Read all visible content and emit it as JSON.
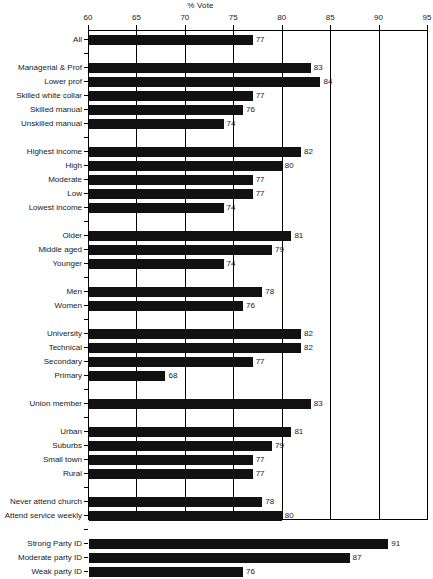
{
  "chart_data": {
    "type": "bar",
    "orientation": "horizontal",
    "title": "% Vote",
    "xlabel": "",
    "ylabel": "",
    "xlim": [
      60,
      95
    ],
    "xticks": [
      60,
      65,
      70,
      75,
      80,
      85,
      90,
      95
    ],
    "grid": true,
    "legend": null,
    "bar_color": "#111111",
    "categories": [
      "All",
      "Managerial & Prof",
      "Lower prof",
      "Skilled white collar",
      "Skilled manual",
      "Unskilled manual",
      "Highest income",
      "High",
      "Moderate",
      "Low",
      "Lowest income",
      "Older",
      "Middle aged",
      "Younger",
      "Men",
      "Women",
      "University",
      "Technical",
      "Secondary",
      "Primary",
      "Union member",
      "Urban",
      "Suburbs",
      "Small town",
      "Rural",
      "Never attend church",
      "Attend service weekly",
      "Strong Party ID",
      "Moderate party ID",
      "Weak party ID"
    ],
    "values": [
      77,
      83,
      84,
      77,
      76,
      74,
      82,
      80,
      77,
      77,
      74,
      81,
      79,
      74,
      78,
      76,
      82,
      82,
      77,
      68,
      83,
      81,
      79,
      77,
      77,
      78,
      80,
      91,
      87,
      76
    ],
    "groups": [
      {
        "name": "overall",
        "categories": [
          "All"
        ]
      },
      {
        "name": "occupation",
        "categories": [
          "Managerial & Prof",
          "Lower prof",
          "Skilled white collar",
          "Skilled manual",
          "Unskilled manual"
        ]
      },
      {
        "name": "income",
        "categories": [
          "Highest income",
          "High",
          "Moderate",
          "Low",
          "Lowest income"
        ]
      },
      {
        "name": "age",
        "categories": [
          "Older",
          "Middle aged",
          "Younger"
        ]
      },
      {
        "name": "gender",
        "categories": [
          "Men",
          "Women"
        ]
      },
      {
        "name": "education",
        "categories": [
          "University",
          "Technical",
          "Secondary",
          "Primary"
        ]
      },
      {
        "name": "union",
        "categories": [
          "Union member"
        ]
      },
      {
        "name": "residence",
        "categories": [
          "Urban",
          "Suburbs",
          "Small town",
          "Rural"
        ]
      },
      {
        "name": "religion",
        "categories": [
          "Never attend church",
          "Attend service weekly"
        ]
      },
      {
        "name": "party-id",
        "categories": [
          "Strong Party ID",
          "Moderate party ID",
          "Weak party ID"
        ]
      }
    ]
  }
}
